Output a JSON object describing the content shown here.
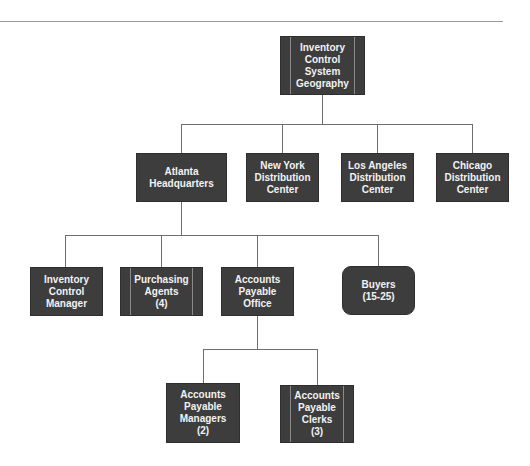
{
  "diagram": {
    "type": "org-chart",
    "nodes": {
      "root": {
        "label": "Inventory\nControl\nSystem\nGeography",
        "style": "barred"
      },
      "atlanta": {
        "label": "Atlanta\nHeadquarters",
        "style": "plain"
      },
      "new_york": {
        "label": "New York\nDistribution\nCenter",
        "style": "plain"
      },
      "los_angeles": {
        "label": "Los Angeles\nDistribution\nCenter",
        "style": "plain"
      },
      "chicago": {
        "label": "Chicago\nDistribution\nCenter",
        "style": "plain"
      },
      "inventory_manager": {
        "label": "Inventory\nControl\nManager",
        "style": "plain"
      },
      "purchasing_agents": {
        "label": "Purchasing\nAgents\n(4)",
        "style": "barred"
      },
      "ap_office": {
        "label": "Accounts\nPayable\nOffice",
        "style": "plain"
      },
      "buyers": {
        "label": "Buyers\n(15-25)",
        "style": "rounded"
      },
      "ap_managers": {
        "label": "Accounts\nPayable\nManagers\n(2)",
        "style": "plain"
      },
      "ap_clerks": {
        "label": "Accounts\nPayable\nClerks\n(3)",
        "style": "barred"
      }
    },
    "edges": [
      [
        "root",
        "atlanta"
      ],
      [
        "root",
        "new_york"
      ],
      [
        "root",
        "los_angeles"
      ],
      [
        "root",
        "chicago"
      ],
      [
        "atlanta",
        "inventory_manager"
      ],
      [
        "atlanta",
        "purchasing_agents"
      ],
      [
        "atlanta",
        "ap_office"
      ],
      [
        "atlanta",
        "buyers"
      ],
      [
        "ap_office",
        "ap_managers"
      ],
      [
        "ap_office",
        "ap_clerks"
      ]
    ],
    "colors": {
      "node_fill": "#3d3d3d",
      "node_text": "#f2f2f2",
      "connector": "#6e6e6e"
    }
  }
}
